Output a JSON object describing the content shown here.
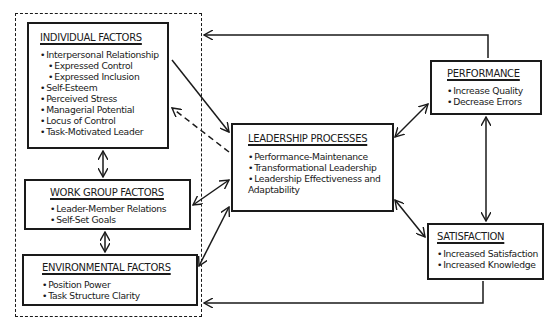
{
  "diagram": {
    "groups": {
      "antecedents_label": ""
    },
    "individual": {
      "title": "INDIVIDUAL FACTORS",
      "items": [
        {
          "label": "Interpersonal Relationship",
          "level": 0
        },
        {
          "label": "Expressed Control",
          "level": 1
        },
        {
          "label": "Expressed Inclusion",
          "level": 1
        },
        {
          "label": "Self-Esteem",
          "level": 0
        },
        {
          "label": "Perceived Stress",
          "level": 0
        },
        {
          "label": "Managerial Potential",
          "level": 0
        },
        {
          "label": "Locus of Control",
          "level": 0
        },
        {
          "label": "Task-Motivated Leader",
          "level": 0
        }
      ]
    },
    "workgroup": {
      "title": "WORK GROUP FACTORS",
      "items": [
        "Leader-Member Relations",
        "Self-Set Goals"
      ]
    },
    "environmental": {
      "title": "ENVIRONMENTAL FACTORS",
      "items": [
        "Position Power",
        "Task Structure Clarity"
      ]
    },
    "leadership": {
      "title": "LEADERSHIP PROCESSES",
      "items": [
        "Performance-Maintenance",
        "Transformational Leadership",
        "Leadership Effectiveness and",
        "Adaptability"
      ]
    },
    "performance": {
      "title": "PERFORMANCE",
      "items": [
        "Increase Quality",
        "Decrease Errors"
      ]
    },
    "satisfaction": {
      "title": "SATISFACTION",
      "items": [
        "Increased Satisfaction",
        "Increased Knowledge"
      ]
    },
    "edges": [
      {
        "from": "individual",
        "to": "leadership",
        "style": "solid",
        "direction": "forward"
      },
      {
        "from": "leadership",
        "to": "individual",
        "style": "dashed",
        "direction": "forward"
      },
      {
        "from": "individual",
        "to": "workgroup",
        "style": "solid",
        "direction": "both"
      },
      {
        "from": "workgroup",
        "to": "environmental",
        "style": "solid",
        "direction": "both"
      },
      {
        "from": "workgroup",
        "to": "leadership",
        "style": "solid",
        "direction": "both"
      },
      {
        "from": "environmental",
        "to": "leadership",
        "style": "solid",
        "direction": "both"
      },
      {
        "from": "leadership",
        "to": "performance",
        "style": "solid",
        "direction": "both"
      },
      {
        "from": "leadership",
        "to": "satisfaction",
        "style": "solid",
        "direction": "both"
      },
      {
        "from": "performance",
        "to": "satisfaction",
        "style": "solid",
        "direction": "both"
      },
      {
        "from": "performance",
        "to": "antecedents",
        "style": "solid",
        "direction": "forward"
      },
      {
        "from": "satisfaction",
        "to": "antecedents",
        "style": "solid",
        "direction": "forward"
      }
    ]
  }
}
